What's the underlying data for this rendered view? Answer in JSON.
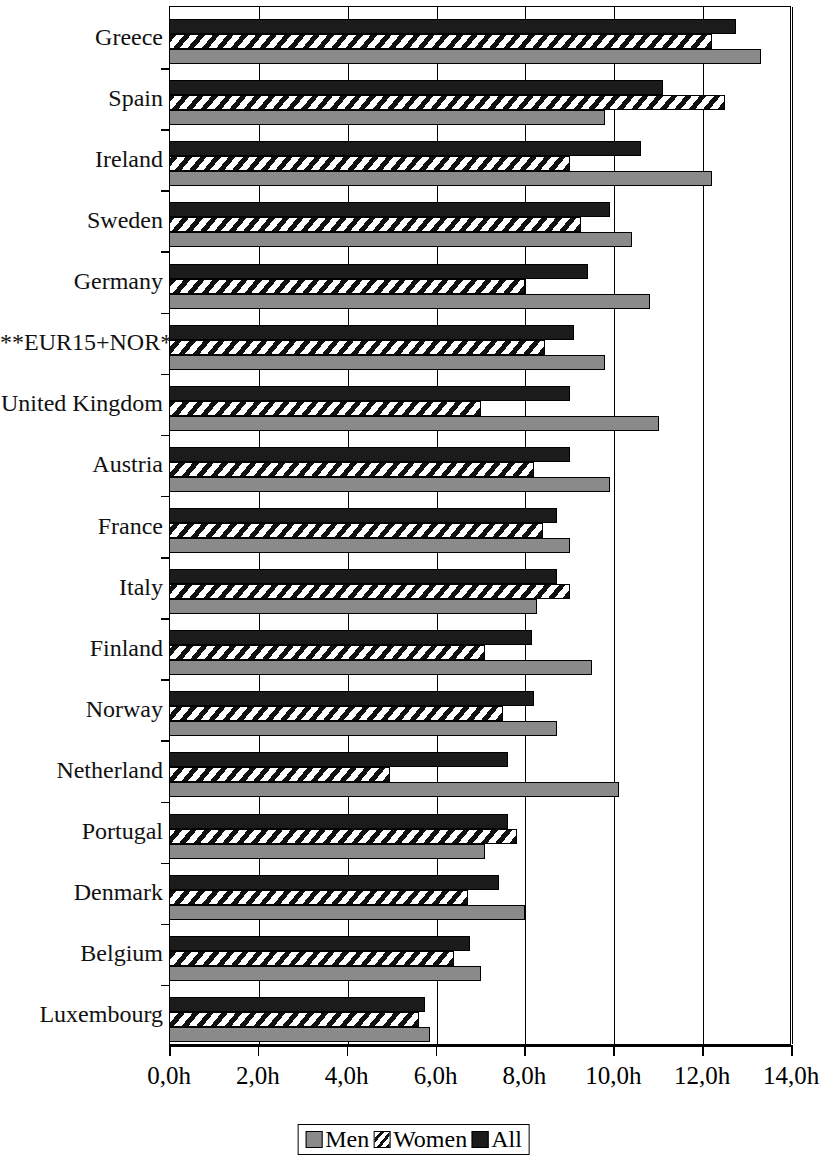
{
  "chart_data": {
    "type": "bar",
    "orientation": "horizontal",
    "title": "",
    "xlabel": "",
    "ylabel": "",
    "xlim": [
      0,
      14
    ],
    "grid": true,
    "legend_position": "bottom",
    "xticks": [
      "0,0h",
      "2,0h",
      "4,0h",
      "6,0h",
      "8,0h",
      "10,0h",
      "12,0h",
      "14,0h"
    ],
    "xtick_values": [
      0,
      2,
      4,
      6,
      8,
      10,
      12,
      14
    ],
    "categories": [
      "Greece",
      "Spain",
      "Ireland",
      "Sweden",
      "Germany",
      "**EUR15+NOR*",
      "United Kingdom",
      "Austria",
      "France",
      "Italy",
      "Finland",
      "Norway",
      "Netherland",
      "Portugal",
      "Denmark",
      "Belgium",
      "Luxembourg"
    ],
    "series": [
      {
        "name": "All",
        "color": "#1b1b1b",
        "values": [
          12.75,
          11.1,
          10.6,
          9.9,
          9.4,
          9.1,
          9.0,
          9.0,
          8.7,
          8.7,
          8.15,
          8.2,
          7.6,
          7.6,
          7.4,
          6.75,
          5.75
        ]
      },
      {
        "name": "Women",
        "color": "#ffffff",
        "values": [
          12.2,
          12.5,
          9.0,
          9.25,
          8.0,
          8.45,
          7.0,
          8.2,
          8.4,
          9.0,
          7.1,
          7.5,
          4.95,
          7.8,
          6.7,
          6.4,
          5.6
        ]
      },
      {
        "name": "Men",
        "color": "#8a8a8a",
        "values": [
          13.3,
          9.8,
          12.2,
          10.4,
          10.8,
          9.8,
          11.0,
          9.9,
          9.0,
          8.25,
          9.5,
          8.7,
          10.1,
          7.1,
          8.0,
          7.0,
          5.85
        ]
      }
    ]
  },
  "legend": {
    "items": [
      {
        "label": "Men",
        "swatch": "men-swatch"
      },
      {
        "label": "Women",
        "swatch": "women-swatch"
      },
      {
        "label": "All",
        "swatch": "all-swatch"
      }
    ]
  }
}
